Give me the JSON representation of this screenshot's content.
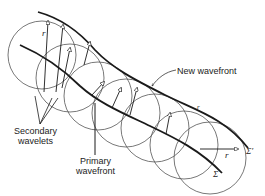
{
  "diagram": {
    "labels": {
      "new_wavefront": "New wavefront",
      "secondary_wavelets_line1": "Secondary",
      "secondary_wavelets_line2": "wavelets",
      "primary_wavefront_line1": "Primary",
      "primary_wavefront_line2": "wavefront",
      "radius_symbol": "r",
      "sigma": "Σ",
      "sigma_prime": "Σ′"
    },
    "colors": {
      "stroke": "#1a1a1a",
      "circle": "#555555",
      "background": "#ffffff"
    },
    "wavelet_circles": [
      {
        "cx": 42,
        "cy": 55,
        "r": 34
      },
      {
        "cx": 72,
        "cy": 77,
        "r": 34
      },
      {
        "cx": 100,
        "cy": 96,
        "r": 34
      },
      {
        "cx": 128,
        "cy": 112,
        "r": 34
      },
      {
        "cx": 156,
        "cy": 128,
        "r": 34
      },
      {
        "cx": 184,
        "cy": 145,
        "r": 34
      },
      {
        "cx": 212,
        "cy": 158,
        "r": 36
      }
    ]
  }
}
